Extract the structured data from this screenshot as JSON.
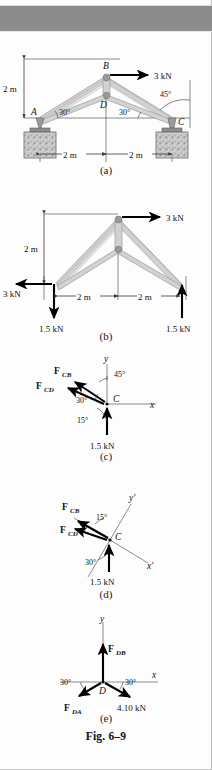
{
  "page": {
    "figure_caption": "Fig. 6–9",
    "background": "#fdfdfd",
    "band_color": "#8c8c8c"
  },
  "figures": [
    {
      "id": "a",
      "caption": "(a)",
      "type": "truss-with-supports",
      "joints": [
        "A",
        "B",
        "C",
        "D"
      ],
      "labels": {
        "joint_a": "A",
        "joint_b": "B",
        "joint_c": "C",
        "joint_d": "D"
      },
      "dimensions": [
        {
          "name": "height",
          "text": "2 m"
        },
        {
          "name": "span-left",
          "text": "2 m"
        },
        {
          "name": "span-right",
          "text": "2 m"
        }
      ],
      "angles": [
        {
          "name": "angle-at-a",
          "text": "30°"
        },
        {
          "name": "angle-at-d-right",
          "text": "30°"
        },
        {
          "name": "angle-at-c",
          "text": "45°"
        }
      ],
      "loads": [
        {
          "name": "applied-load-b",
          "text": "3 kN",
          "direction": "right"
        }
      ]
    },
    {
      "id": "b",
      "caption": "(b)",
      "type": "free-body-diagram",
      "dimensions": [
        {
          "name": "height",
          "text": "2 m"
        },
        {
          "name": "span-left",
          "text": "2 m"
        },
        {
          "name": "span-right",
          "text": "2 m"
        }
      ],
      "loads": [
        {
          "name": "applied-load-top",
          "text": "3 kN",
          "direction": "right"
        },
        {
          "name": "reaction-ax",
          "text": "3 kN",
          "direction": "left"
        },
        {
          "name": "reaction-ay",
          "text": "1.5 kN",
          "direction": "down"
        },
        {
          "name": "reaction-cy",
          "text": "1.5 kN",
          "direction": "up"
        }
      ]
    },
    {
      "id": "c",
      "caption": "(c)",
      "type": "joint-fbd",
      "joint": "C",
      "axes": {
        "x": "x",
        "y": "y"
      },
      "forces": [
        {
          "name": "force-cb",
          "symbol": "F",
          "subscript": "CB"
        },
        {
          "name": "force-cd",
          "symbol": "F",
          "subscript": "CD"
        },
        {
          "name": "reaction",
          "text": "1.5 kN"
        }
      ],
      "angles": [
        {
          "name": "angle-45",
          "text": "45°"
        },
        {
          "name": "angle-30",
          "text": "30°"
        },
        {
          "name": "angle-15",
          "text": "15°"
        }
      ]
    },
    {
      "id": "d",
      "caption": "(d)",
      "type": "joint-fbd-rotated-axes",
      "joint": "C",
      "axes": {
        "x": "x′",
        "y": "y′"
      },
      "forces": [
        {
          "name": "force-cb",
          "symbol": "F",
          "subscript": "CB"
        },
        {
          "name": "force-cd",
          "symbol": "F",
          "subscript": "CD"
        },
        {
          "name": "reaction",
          "text": "1.5 kN"
        }
      ],
      "angles": [
        {
          "name": "angle-15",
          "text": "15°"
        },
        {
          "name": "angle-30",
          "text": "30°"
        }
      ]
    },
    {
      "id": "e",
      "caption": "(e)",
      "type": "joint-fbd",
      "joint": "D",
      "axes": {
        "x": "x",
        "y": "y"
      },
      "forces": [
        {
          "name": "force-db",
          "symbol": "F",
          "subscript": "DB"
        },
        {
          "name": "force-da",
          "symbol": "F",
          "subscript": "DA"
        },
        {
          "name": "known-force",
          "text": "4.10 kN"
        }
      ],
      "angles": [
        {
          "name": "angle-left",
          "text": "30°"
        },
        {
          "name": "angle-right",
          "text": "30°"
        }
      ]
    }
  ]
}
